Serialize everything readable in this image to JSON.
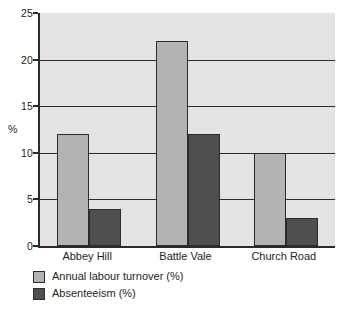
{
  "chart_data": {
    "type": "bar",
    "title": "",
    "subtitle": "",
    "xlabel": "",
    "ylabel": "%",
    "ylim": [
      0,
      25
    ],
    "ytick_values": [
      0,
      5,
      10,
      15,
      20,
      25
    ],
    "ytick_labels": [
      "0",
      "5",
      "10",
      "15",
      "20",
      "25"
    ],
    "grid": "horizontal",
    "gridline_values": [
      5,
      10,
      15,
      20
    ],
    "legend_position": "below-left",
    "categories": [
      "Abbey Hill",
      "Battle Vale",
      "Church Road"
    ],
    "series": [
      {
        "name": "Annual labour turnover (%)",
        "color": "#b3b3b3",
        "values": [
          12,
          22,
          10
        ]
      },
      {
        "name": "Absenteeism (%)",
        "color": "#4f4f4f",
        "values": [
          4,
          12,
          3
        ]
      }
    ]
  },
  "style": {
    "plot_background": "#e3e3e3",
    "axis_color": "#2b2b2b",
    "text_color": "#231f20",
    "page_background": "#ffffff"
  }
}
